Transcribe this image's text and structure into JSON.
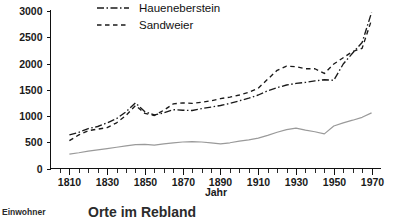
{
  "chart_data": {
    "type": "line",
    "title": "",
    "xlabel": "Jahr",
    "ylabel": "",
    "xlim": [
      1800,
      1975
    ],
    "ylim": [
      0,
      3000
    ],
    "grid": false,
    "legend_position": "top-left",
    "x_ticks": [
      1810,
      1830,
      1850,
      1870,
      1890,
      1910,
      1930,
      1950,
      1970
    ],
    "x_tick_labels": [
      "1810",
      "1830",
      "1850",
      "1870",
      "1890",
      "1910",
      "1930",
      "1950",
      "1970"
    ],
    "x_minor_tick_step": 5,
    "y_ticks": [
      0,
      500,
      1000,
      1500,
      2000,
      2500,
      3000
    ],
    "y_tick_labels": [
      "0",
      "500",
      "1000",
      "1500",
      "2000",
      "2500",
      "3000"
    ],
    "series": [
      {
        "name": "Haueneberstein",
        "style": "dash-dot",
        "color": "#1a1a1a",
        "x": [
          1810,
          1815,
          1820,
          1825,
          1830,
          1835,
          1840,
          1845,
          1850,
          1855,
          1860,
          1865,
          1870,
          1875,
          1880,
          1885,
          1890,
          1895,
          1900,
          1905,
          1910,
          1915,
          1920,
          1925,
          1930,
          1935,
          1940,
          1945,
          1950,
          1955,
          1960,
          1965,
          1970
        ],
        "values": [
          640,
          690,
          760,
          800,
          870,
          950,
          1080,
          1250,
          1080,
          1020,
          1060,
          1120,
          1110,
          1105,
          1140,
          1170,
          1200,
          1240,
          1290,
          1340,
          1400,
          1480,
          1540,
          1590,
          1620,
          1640,
          1670,
          1690,
          1680,
          1990,
          2200,
          2400,
          2970
        ]
      },
      {
        "name": "Sandweier",
        "style": "dashed",
        "color": "#1a1a1a",
        "x": [
          1810,
          1815,
          1820,
          1825,
          1830,
          1835,
          1840,
          1845,
          1850,
          1855,
          1860,
          1865,
          1870,
          1875,
          1880,
          1885,
          1890,
          1895,
          1900,
          1905,
          1910,
          1915,
          1920,
          1925,
          1930,
          1935,
          1940,
          1945,
          1950,
          1955,
          1960,
          1965,
          1970
        ],
        "values": [
          530,
          640,
          720,
          750,
          780,
          870,
          1010,
          1200,
          1050,
          1010,
          1110,
          1230,
          1250,
          1240,
          1260,
          1290,
          1330,
          1360,
          1400,
          1450,
          1530,
          1700,
          1870,
          1950,
          1940,
          1900,
          1900,
          1810,
          1990,
          2110,
          2230,
          2290,
          2830
        ]
      },
      {
        "name": "gesamt",
        "style": "solid",
        "color": "#9a9a9a",
        "x": [
          1810,
          1815,
          1820,
          1825,
          1830,
          1835,
          1840,
          1845,
          1850,
          1855,
          1860,
          1865,
          1870,
          1875,
          1880,
          1885,
          1890,
          1895,
          1900,
          1905,
          1910,
          1915,
          1920,
          1925,
          1930,
          1935,
          1940,
          1945,
          1950,
          1955,
          1960,
          1965,
          1970
        ],
        "values": [
          275,
          300,
          330,
          355,
          380,
          405,
          430,
          455,
          460,
          445,
          470,
          490,
          505,
          510,
          505,
          490,
          470,
          490,
          520,
          545,
          580,
          630,
          690,
          740,
          770,
          730,
          700,
          660,
          810,
          870,
          920,
          975,
          1060
        ]
      }
    ]
  },
  "legend": {
    "items": [
      {
        "label": "Haueneberstein",
        "style": "dash-dot"
      },
      {
        "label": "Sandweier",
        "style": "dashed"
      }
    ]
  },
  "axes": {
    "x_title": "Jahr"
  },
  "caption": {
    "left": "Einwohner",
    "main": "Orte im Rebland"
  }
}
